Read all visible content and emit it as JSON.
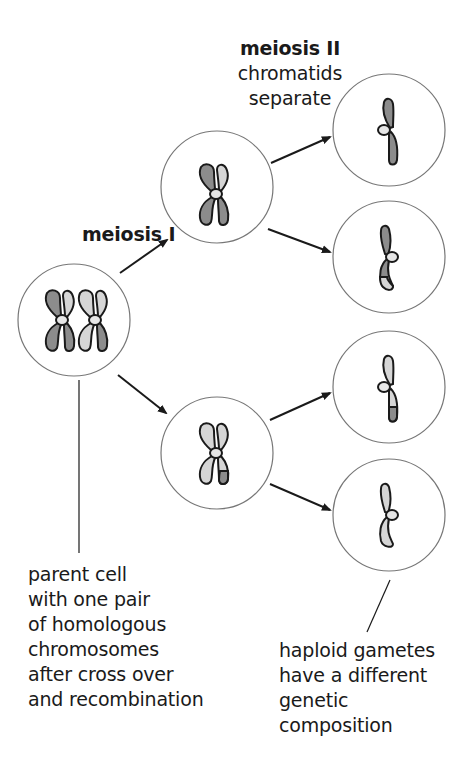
{
  "labels": {
    "meiosis1": "meiosis I",
    "meiosis2_title": "meiosis II",
    "meiosis2_line1": "chromatids",
    "meiosis2_line2": "separate",
    "parent": [
      "parent cell",
      "with one pair",
      "of homologous",
      "chromosomes",
      "after cross over",
      "and recombination"
    ],
    "gametes": [
      "haploid gametes",
      "have a different",
      "genetic",
      "composition"
    ]
  },
  "colors": {
    "dark_chromosome": "#8c8c8c",
    "light_chromosome": "#d6d6d6",
    "outline": "#1a1a1a",
    "circle": "#777777",
    "centromere": "#e6e6e6"
  },
  "cells": [
    {
      "id": "parent",
      "cx": 74,
      "cy": 320
    },
    {
      "id": "meiosis1-top",
      "cx": 217,
      "cy": 187
    },
    {
      "id": "meiosis1-bottom",
      "cx": 217,
      "cy": 453
    },
    {
      "id": "gamete-1",
      "cx": 389,
      "cy": 130
    },
    {
      "id": "gamete-2",
      "cx": 389,
      "cy": 257
    },
    {
      "id": "gamete-3",
      "cx": 389,
      "cy": 387
    },
    {
      "id": "gamete-4",
      "cx": 389,
      "cy": 515
    }
  ]
}
